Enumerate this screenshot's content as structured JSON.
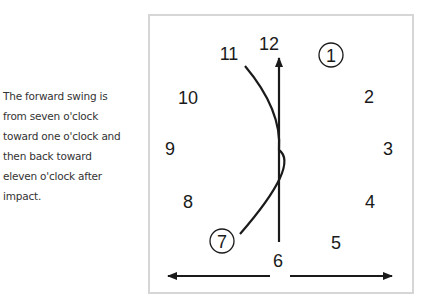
{
  "caption": {
    "lines": [
      "The forward swing is",
      "from seven o'clock",
      "toward one o'clock and",
      "then back toward",
      "eleven o'clock after",
      "impact."
    ]
  },
  "clock": {
    "numerals": {
      "n12": "12",
      "n1": "1",
      "n2": "2",
      "n3": "3",
      "n4": "4",
      "n5": "5",
      "n6": "6",
      "n7": "7",
      "n8": "8",
      "n9": "9",
      "n10": "10",
      "n11": "11"
    },
    "circled": [
      "1",
      "7"
    ],
    "swing_path": {
      "start": "7 o'clock",
      "toward": "1 o'clock",
      "return": "11 o'clock"
    },
    "colors": {
      "line": "#1a1a1a",
      "frame": "#d6d6d6",
      "caption": "#333333"
    }
  }
}
